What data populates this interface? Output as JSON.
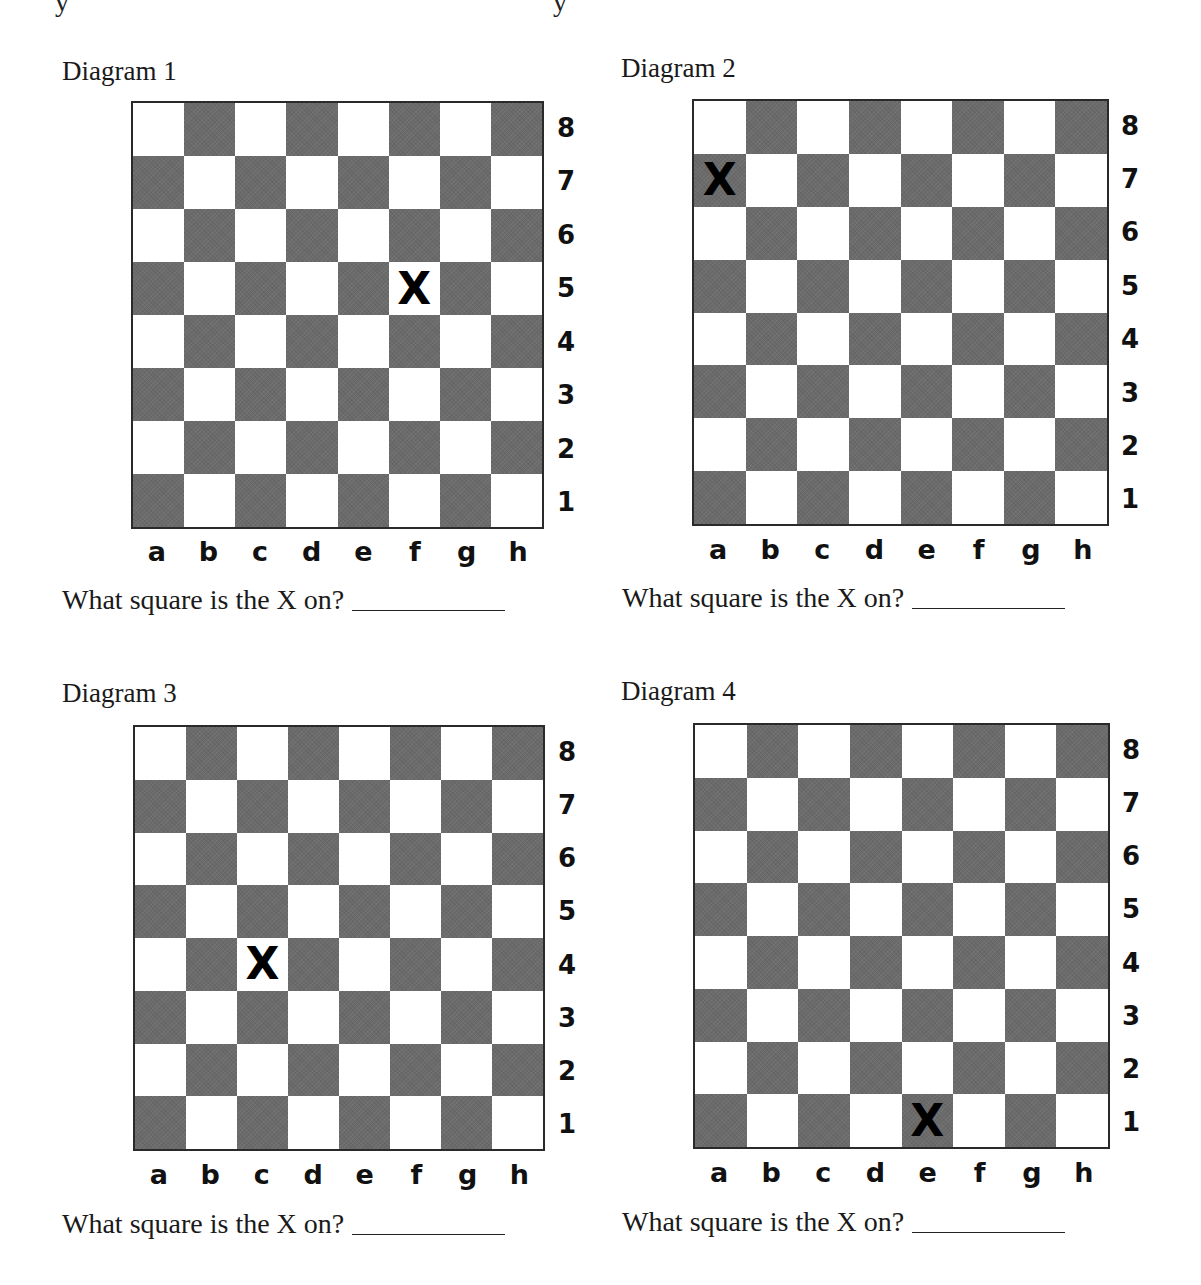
{
  "page": {
    "question_text": "What square is the X on?",
    "files": [
      "a",
      "b",
      "c",
      "d",
      "e",
      "f",
      "g",
      "h"
    ],
    "ranks": [
      "8",
      "7",
      "6",
      "5",
      "4",
      "3",
      "2",
      "1"
    ],
    "marker_glyph": "X",
    "colors": {
      "dark_square": "#6b6b6b",
      "light_square": "#ffffff",
      "text": "#111111"
    }
  },
  "diagrams": [
    {
      "title": "Diagram 1",
      "marker_square": "f5",
      "marker_square_color": "light"
    },
    {
      "title": "Diagram 2",
      "marker_square": "a7",
      "marker_square_color": "dark"
    },
    {
      "title": "Diagram 3",
      "marker_square": "c4",
      "marker_square_color": "light"
    },
    {
      "title": "Diagram 4",
      "marker_square": "e1",
      "marker_square_color": "dark"
    }
  ]
}
